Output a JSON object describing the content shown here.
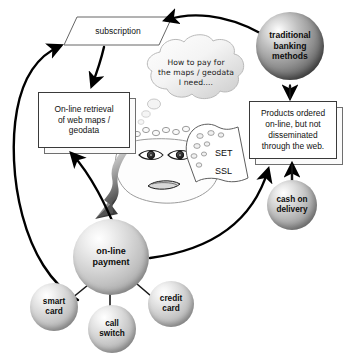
{
  "diagram": {
    "background_color": "#ffffff"
  },
  "nodes": {
    "subscription": {
      "label": "subscription",
      "shape": "parallelogram"
    },
    "online_retrieval": {
      "label": "On-line retrieval\nof web maps /\ngeodata",
      "shape": "stacked-box"
    },
    "products_ordered": {
      "label": "Products ordered\non-line, but not\ndisseminated\nthrough the web.",
      "shape": "stacked-box"
    },
    "traditional_banking": {
      "label": "traditional\nbanking\nmethods",
      "shape": "sphere",
      "tone": "dark"
    },
    "cash_on_delivery": {
      "label": "cash on\ndelivery",
      "shape": "sphere",
      "tone": "mid"
    },
    "online_payment": {
      "label": "on-line\npayment",
      "shape": "sphere",
      "tone": "light"
    },
    "smart_card": {
      "label": "smart\ncard",
      "shape": "sphere",
      "tone": "light"
    },
    "call_switch": {
      "label": "call\nswitch",
      "shape": "sphere",
      "tone": "light"
    },
    "credit_card": {
      "label": "credit\ncard",
      "shape": "sphere",
      "tone": "light"
    }
  },
  "thought_bubble": {
    "text": "How to pay for\nthe maps / geodata\nI need...."
  },
  "security_flag": {
    "line1": "SET",
    "line2": "SSL"
  },
  "colors": {
    "stroke": "#111111",
    "box_border": "#3a3a3a",
    "shadow_border": "#6f6f6f",
    "bubble_fill": "#f2f2f2",
    "gray_arrow": "#8a8a8a"
  }
}
